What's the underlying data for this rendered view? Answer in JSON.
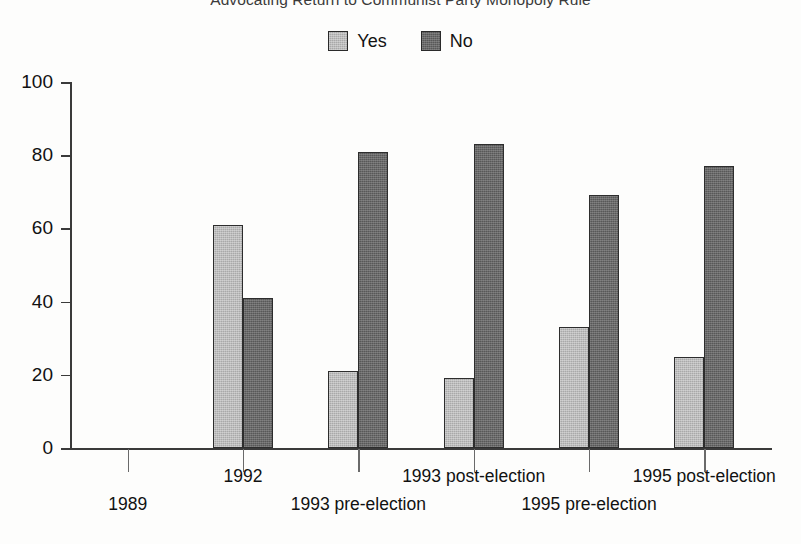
{
  "chart_data": {
    "type": "bar",
    "title": "Advocating Return to Communist Party Monopoly Rule",
    "xlabel": "",
    "ylabel": "",
    "ylim": [
      0,
      100
    ],
    "yticks": [
      0,
      20,
      40,
      60,
      80,
      100
    ],
    "grid": false,
    "legend_position": "top-center",
    "categories": [
      "1989",
      "1992",
      "1993 pre-election",
      "1993 post-election",
      "1995 pre-election",
      "1995 post-election"
    ],
    "series": [
      {
        "name": "Yes",
        "color": "#a9a9a9",
        "values": [
          null,
          61,
          21,
          19,
          33,
          25
        ]
      },
      {
        "name": "No",
        "color": "#585858",
        "values": [
          null,
          41,
          81,
          83,
          69,
          77
        ]
      }
    ]
  },
  "legend": {
    "items": [
      {
        "label": "Yes",
        "color": "#a9a9a9"
      },
      {
        "label": "No",
        "color": "#585858"
      }
    ]
  },
  "axis": {
    "y_labels": [
      "100",
      "80",
      "60",
      "40",
      "20",
      "0"
    ]
  },
  "x_labels": [
    "1989",
    "1992",
    "1993 pre-election",
    "1993 post-election",
    "1995 pre-election",
    "1995 post-election"
  ]
}
